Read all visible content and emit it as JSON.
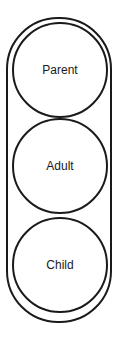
{
  "diagram": {
    "title": "",
    "container": "pill",
    "nodes": [
      {
        "label": "Parent"
      },
      {
        "label": "Adult"
      },
      {
        "label": "Child"
      }
    ],
    "colors": {
      "stroke": "#1a1a1a",
      "background": "#ffffff"
    }
  }
}
